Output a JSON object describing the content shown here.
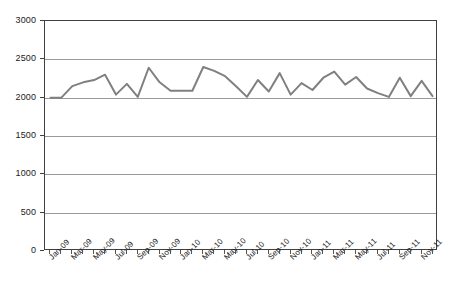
{
  "chart_data": {
    "type": "line",
    "title": "",
    "subtitle": "",
    "xlabel": "",
    "ylabel": "",
    "ylim": [
      0,
      3000
    ],
    "ytick_step": 500,
    "yticks": [
      "0",
      "500",
      "1000",
      "1500",
      "2000",
      "2500",
      "3000"
    ],
    "grid": true,
    "legend": "none",
    "series_color": "#808080",
    "axis_color": "#404040",
    "grid_color": "#9a9a9a",
    "x": [
      "Jan-09",
      "Feb-09",
      "Mar-09",
      "Apr-09",
      "May-09",
      "Jun-09",
      "Jul-09",
      "Aug-09",
      "Sep-09",
      "Oct-09",
      "Nov-09",
      "Dec-09",
      "Jan-10",
      "Feb-10",
      "Mar-10",
      "Apr-10",
      "May-10",
      "Jun-10",
      "Jul-10",
      "Aug-10",
      "Sep-10",
      "Oct-10",
      "Nov-10",
      "Dec-10",
      "Jan-11",
      "Feb-11",
      "Mar-11",
      "Apr-11",
      "May-11",
      "Jun-11",
      "Jul-11",
      "Aug-11",
      "Sep-11",
      "Oct-11",
      "Nov-11",
      "Dec-11"
    ],
    "xtick_labels": [
      "Jan-09",
      "Mar-09",
      "May-09",
      "Jul-09",
      "Sep-09",
      "Nov-09",
      "Jan-10",
      "Mar-10",
      "May-10",
      "Jul-10",
      "Sep-10",
      "Nov-10",
      "Jan-11",
      "Mar-11",
      "May-11",
      "Jul-11",
      "Sep-11",
      "Nov-11"
    ],
    "xtick_label_interval": 2,
    "series": [
      {
        "name": "Series 1",
        "values": [
          2000,
          2000,
          2150,
          2200,
          2230,
          2300,
          2040,
          2180,
          2010,
          2390,
          2200,
          2090,
          2090,
          2090,
          2400,
          2350,
          2280,
          2150,
          2010,
          2230,
          2080,
          2320,
          2040,
          2190,
          2100,
          2260,
          2340,
          2170,
          2270,
          2120,
          2060,
          2010,
          2260,
          2020,
          2220,
          2020
        ]
      }
    ]
  }
}
